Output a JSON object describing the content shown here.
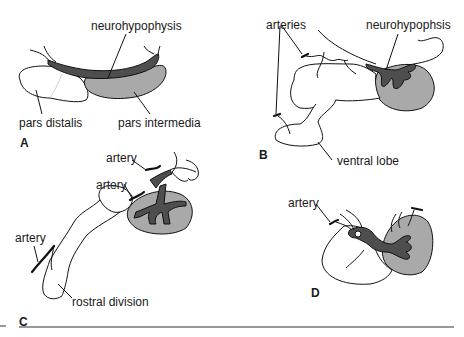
{
  "figure": {
    "panels": [
      {
        "letter": "A",
        "labels": {
          "neurohypophysis": "neurohypophysis",
          "pars_distalis": "pars distalis",
          "pars_intermedia": "pars intermedia"
        }
      },
      {
        "letter": "B",
        "labels": {
          "arteries": "arteries",
          "neurohypophysis": "neurohypophsis",
          "ventral_lobe": "ventral lobe"
        }
      },
      {
        "letter": "C",
        "labels": {
          "artery_top": "artery",
          "artery_mid": "artery",
          "artery_left": "artery",
          "rostral_division": "rostral division"
        }
      },
      {
        "letter": "D",
        "labels": {
          "artery": "artery"
        }
      }
    ],
    "colors": {
      "pars_intermedia_fill": "#a9a9a9",
      "neurohypophysis_fill": "#4e4e4e",
      "outline": "#111111",
      "background": "#ffffff"
    }
  }
}
